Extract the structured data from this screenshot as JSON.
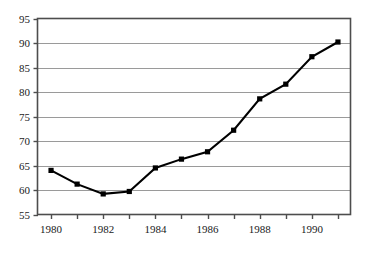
{
  "chart_data": {
    "type": "line",
    "title": "",
    "xlabel": "",
    "ylabel": "",
    "x": [
      1980,
      1981,
      1982,
      1983,
      1984,
      1985,
      1986,
      1987,
      1988,
      1989,
      1990,
      1991
    ],
    "values": [
      64.0,
      61.2,
      59.2,
      59.7,
      64.5,
      66.3,
      67.8,
      72.2,
      78.6,
      81.6,
      87.2,
      90.2
    ],
    "series": [
      {
        "name": "",
        "values": [
          64.0,
          61.2,
          59.2,
          59.7,
          64.5,
          66.3,
          67.8,
          72.2,
          78.6,
          81.6,
          87.2,
          90.2
        ]
      }
    ],
    "xlim": [
      1979.5,
      1991.5
    ],
    "ylim": [
      55,
      95
    ],
    "y_ticks": [
      55,
      60,
      65,
      70,
      75,
      80,
      85,
      90,
      95
    ],
    "y_tick_labels": [
      "55",
      "60",
      "65",
      "70",
      "75",
      "80",
      "85",
      "90",
      "95"
    ],
    "x_ticks": [
      1980,
      1981,
      1982,
      1983,
      1984,
      1985,
      1986,
      1987,
      1988,
      1989,
      1990,
      1991
    ],
    "x_tick_labels": [
      "1980",
      "",
      "1982",
      "",
      "1984",
      "",
      "1986",
      "",
      "1988",
      "",
      "1990",
      ""
    ],
    "x_labels_shown": [
      "1980",
      "1982",
      "1984",
      "1986",
      "1988",
      "1990"
    ],
    "grid": "horizontal",
    "legend": "none",
    "marker": "square",
    "colors": {
      "line": "#000000",
      "marker": "#000000",
      "grid": "#9a9a9a",
      "axis": "#4d4d4d",
      "background": "#ffffff",
      "text": "#1a1a1a"
    }
  }
}
